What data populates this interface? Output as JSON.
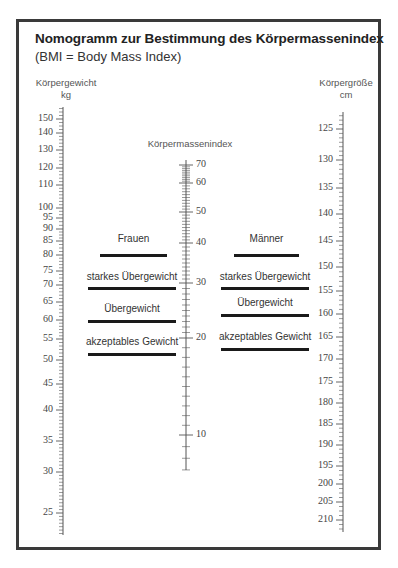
{
  "header": {
    "title": "Nomogramm zur Bestimmung des Körpermassenindex",
    "subtitle": "(BMI = Body Mass Index)"
  },
  "axes": {
    "weight": {
      "label": "Körpergewicht",
      "unit": "kg",
      "ticks": [
        {
          "value": "150",
          "y": 119
        },
        {
          "value": "140",
          "y": 133
        },
        {
          "value": "130",
          "y": 150
        },
        {
          "value": "120",
          "y": 168
        },
        {
          "value": "110",
          "y": 185
        },
        {
          "value": "100",
          "y": 208
        },
        {
          "value": "95",
          "y": 218
        },
        {
          "value": "90",
          "y": 229
        },
        {
          "value": "85",
          "y": 241
        },
        {
          "value": "80",
          "y": 255
        },
        {
          "value": "75",
          "y": 271
        },
        {
          "value": "70",
          "y": 285
        },
        {
          "value": "65",
          "y": 302
        },
        {
          "value": "60",
          "y": 320
        },
        {
          "value": "55",
          "y": 339
        },
        {
          "value": "50",
          "y": 360
        },
        {
          "value": "45",
          "y": 384
        },
        {
          "value": "40",
          "y": 410
        },
        {
          "value": "35",
          "y": 441
        },
        {
          "value": "30",
          "y": 472
        },
        {
          "value": "25",
          "y": 513
        }
      ]
    },
    "bmi": {
      "label": "Körpermassenindex",
      "ticks": [
        {
          "value": "70",
          "y": 165
        },
        {
          "value": "60",
          "y": 183
        },
        {
          "value": "50",
          "y": 212
        },
        {
          "value": "40",
          "y": 243
        },
        {
          "value": "30",
          "y": 283
        },
        {
          "value": "20",
          "y": 338
        },
        {
          "value": "10",
          "y": 435
        }
      ]
    },
    "height": {
      "label": "Körpergröße",
      "unit": "cm",
      "ticks": [
        {
          "value": "125",
          "y": 129
        },
        {
          "value": "130",
          "y": 160
        },
        {
          "value": "135",
          "y": 188
        },
        {
          "value": "140",
          "y": 214
        },
        {
          "value": "145",
          "y": 241
        },
        {
          "value": "150",
          "y": 267
        },
        {
          "value": "155",
          "y": 291
        },
        {
          "value": "160",
          "y": 314
        },
        {
          "value": "165",
          "y": 337
        },
        {
          "value": "170",
          "y": 359
        },
        {
          "value": "175",
          "y": 382
        },
        {
          "value": "180",
          "y": 403
        },
        {
          "value": "185",
          "y": 424
        },
        {
          "value": "190",
          "y": 445
        },
        {
          "value": "195",
          "y": 466
        },
        {
          "value": "200",
          "y": 484
        },
        {
          "value": "205",
          "y": 502
        },
        {
          "value": "210",
          "y": 520
        }
      ]
    }
  },
  "categories": {
    "women": {
      "label": "Frauen",
      "items": [
        {
          "label": "starkes Übergewicht"
        },
        {
          "label": "Übergewicht"
        },
        {
          "label": "akzeptables Gewicht"
        }
      ]
    },
    "men": {
      "label": "Männer",
      "items": [
        {
          "label": "starkes Übergewicht"
        },
        {
          "label": "Übergewicht"
        },
        {
          "label": "akzeptables Gewicht"
        }
      ]
    }
  },
  "colors": {
    "frame": "#3a3a3a",
    "ink": "#1a1a1a",
    "scale": "#555555"
  }
}
